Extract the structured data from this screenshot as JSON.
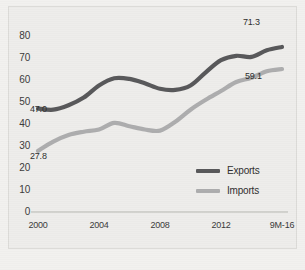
{
  "chart_data": {
    "type": "line",
    "title": "",
    "subtitle": "",
    "xlabel": "",
    "ylabel": "",
    "ylim": [
      0,
      85
    ],
    "yticks": [
      0,
      10,
      20,
      30,
      40,
      50,
      60,
      70,
      80
    ],
    "grid": false,
    "legend_position": "inside-lower-right",
    "x": [
      2000,
      2001,
      2002,
      2003,
      2004,
      2005,
      2006,
      2007,
      2008,
      2009,
      2010,
      2011,
      2012,
      2013,
      2014,
      2015,
      2016
    ],
    "xtick_labels": [
      "2000",
      "2004",
      "2008",
      "2012",
      "9M-16"
    ],
    "xtick_values": [
      2000,
      2004,
      2008,
      2012,
      2016
    ],
    "series": [
      {
        "name": "Exports",
        "color": "#58585a",
        "values": [
          47.0,
          46.5,
          48.5,
          52.0,
          57.5,
          60.8,
          60.5,
          58.5,
          56.0,
          55.5,
          57.5,
          63.5,
          69.0,
          71.0,
          70.5,
          73.5,
          75.0
        ]
      },
      {
        "name": "Imports",
        "color": "#adadae",
        "values": [
          27.8,
          32.0,
          35.0,
          36.5,
          37.5,
          40.5,
          39.0,
          37.5,
          37.0,
          41.0,
          46.5,
          51.0,
          55.0,
          59.1,
          61.0,
          64.0,
          65.0
        ]
      }
    ],
    "point_labels": [
      {
        "text": "47.0",
        "series": "Exports",
        "x": 2000,
        "value": 47.0
      },
      {
        "text": "71.3",
        "series": "Exports",
        "x": 2016,
        "value": 71.3
      },
      {
        "text": "27.8",
        "series": "Imports",
        "x": 2000,
        "value": 27.8
      },
      {
        "text": "59.1",
        "series": "Imports",
        "x": 2016,
        "value": 59.1
      }
    ]
  },
  "axis": {
    "y_ticks": [
      "80",
      "70",
      "60",
      "50",
      "40",
      "30",
      "20",
      "10",
      "0"
    ],
    "x_ticks": [
      "2000",
      "2004",
      "2008",
      "2012",
      "9M-16"
    ]
  },
  "legend": {
    "items": [
      {
        "label": "Exports",
        "color": "#58585a"
      },
      {
        "label": "Imports",
        "color": "#adadae"
      }
    ]
  },
  "labels": {
    "exports_start": "47.0",
    "exports_end": "71.3",
    "imports_start": "27.8",
    "imports_end": "59.1"
  },
  "colors": {
    "background": "#eeedeb",
    "page": "#f2f1ef",
    "exports": "#58585a",
    "imports": "#adadae",
    "axis_line": "#c9c8c5",
    "text": "#3a3a3a"
  }
}
